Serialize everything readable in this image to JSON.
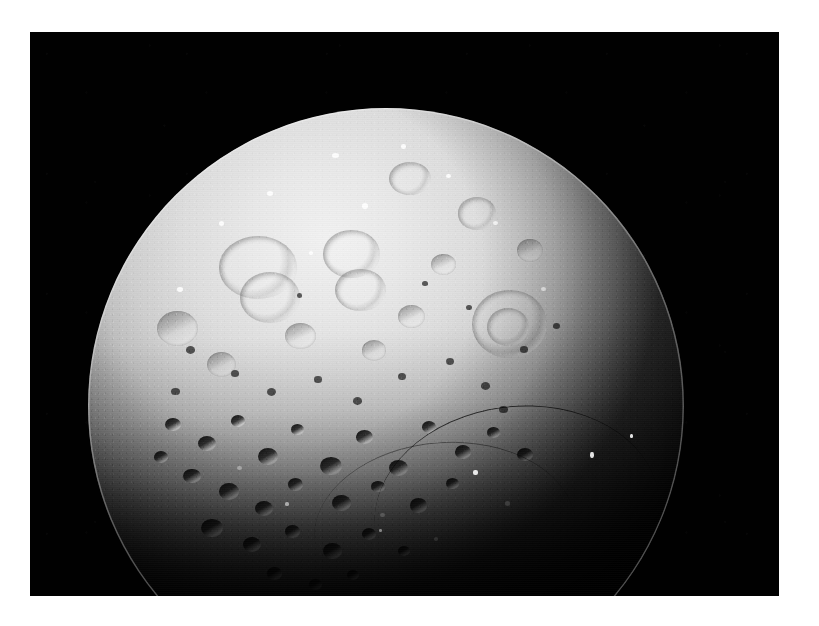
{
  "page": {
    "background_color": "#ffffff",
    "width": 819,
    "height": 626
  },
  "photo": {
    "name": "moon-photograph",
    "alt_text": "Heavily cratered grey icy moon lit from the upper left against black space",
    "frame": {
      "x": 30,
      "y": 32,
      "width": 749,
      "height": 564
    },
    "background_color": "#010101",
    "subject": "icy cratered moon",
    "illumination": "sunlit from upper left, terminator across lower right",
    "colors": {
      "sky": "#010101",
      "highlight": "#f2f2f2",
      "midtone": "#b9b9b9",
      "shadow": "#3c3c3c",
      "terminator": "#060606",
      "border": "#ffffff"
    }
  },
  "body": {
    "name": "moon-disc",
    "center_x": 386,
    "center_y": 406,
    "radius": 298,
    "limb_top_y": 108,
    "limb_left_x": 118,
    "limb_right_x": 714
  },
  "features": {
    "large_craters": [
      {
        "label": "western double basin",
        "cx": 31,
        "cy": 27,
        "d": 14
      },
      {
        "label": "central bright basin",
        "cx": 45,
        "cy": 26,
        "d": 11
      },
      {
        "label": "upper central crater",
        "cx": 39,
        "cy": 20,
        "d": 9
      },
      {
        "label": "eastern ringed crater",
        "cx": 68,
        "cy": 35,
        "d": 13
      },
      {
        "label": "north polar crater",
        "cx": 55,
        "cy": 13,
        "d": 8
      }
    ],
    "terrain": "saturated impact cratering, densely pitted regolith",
    "scarp": "dark arcuate ridge near southeastern terminator"
  }
}
